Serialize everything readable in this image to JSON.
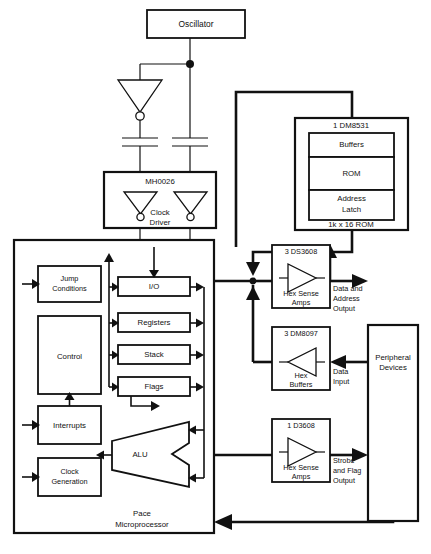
{
  "diagram": {
    "colors": {
      "line": "#111111",
      "background": "#ffffff",
      "text": "#111111"
    }
  },
  "oscillator": {
    "label": "Oscillator"
  },
  "clock_driver": {
    "part": "MH0026",
    "label_line1": "Clock",
    "label_line2": "Driver"
  },
  "rom": {
    "part": "1 DM8531",
    "buffers": "Buffers",
    "rom": "ROM",
    "address_latch_line1": "Address",
    "address_latch_line2": "Latch",
    "footer": "1k x 16 ROM"
  },
  "sense_amps_top": {
    "part": "3 DS3608",
    "label_line1": "Hex Sense",
    "label_line2": "Amps",
    "output_line1": "Data and",
    "output_line2": "Address",
    "output_line3": "Output"
  },
  "hex_buffers": {
    "part": "3 DM8097",
    "label_line1": "Hex",
    "label_line2": "Buffers",
    "input_line1": "Data",
    "input_line2": "Input"
  },
  "sense_amps_bottom": {
    "part": "1 D3608",
    "label_line1": "Hex Sense",
    "label_line2": "Amps",
    "output_line1": "Strobe",
    "output_line2": "and Flag",
    "output_line3": "Output"
  },
  "peripheral_devices": {
    "label_line1": "Peripheral",
    "label_line2": "Devices"
  },
  "processor": {
    "footer_line1": "Pace",
    "footer_line2": "Microprocessor",
    "left_blocks": [
      {
        "name": "jump-conditions",
        "label_line1": "Jump",
        "label_line2": "Conditions"
      },
      {
        "name": "control",
        "label_line1": "Control",
        "label_line2": ""
      },
      {
        "name": "interrupts",
        "label_line1": "Interrupts",
        "label_line2": ""
      },
      {
        "name": "clock-generation",
        "label_line1": "Clock",
        "label_line2": "Generation"
      }
    ],
    "mid_blocks": [
      {
        "name": "io",
        "label": "I/O"
      },
      {
        "name": "registers",
        "label": "Registers"
      },
      {
        "name": "stack",
        "label": "Stack"
      },
      {
        "name": "flags",
        "label": "Flags"
      }
    ],
    "alu": {
      "label": "ALU"
    }
  },
  "bottom_bus": {
    "label_line1": "Interrupt and Jump",
    "label_line2": "Condition Inputs"
  }
}
